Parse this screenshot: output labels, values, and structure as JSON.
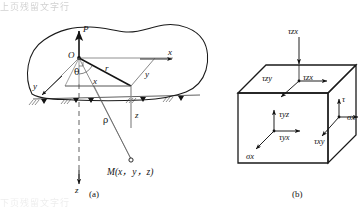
{
  "figure": {
    "caption_a": "(a)",
    "caption_b": "(b)",
    "bleed_top_text": "上页残留文字行",
    "bleed_bottom_text": "下页残留文字行"
  },
  "panel_a": {
    "name": "half-space-coordinate-system",
    "labels": {
      "load_P": "P",
      "origin_O": "O",
      "axis_x": "x",
      "axis_y": "y",
      "axis_z": "z",
      "radial_r": "r",
      "horizontal_x": "x",
      "depth_z": "z",
      "angle_theta": "θ",
      "distance_rho": "ρ",
      "point_M": "M(x，y，z)"
    }
  },
  "panel_b": {
    "name": "stress-element-cube",
    "labels": {
      "top_external": "τzx",
      "top_face_left": "τzy",
      "top_face_right": "τzx",
      "front_face_vertical": "τyz",
      "front_face_horizontal": "τyx",
      "front_face_normal": "σx",
      "right_face_vertical": "τ",
      "right_face_diagonal": "τxy",
      "right_face_normal": "σx"
    },
    "symbols": {
      "tau": "τ",
      "sigma": "σ"
    }
  },
  "colors": {
    "ink": "#141414",
    "line": "#1a1a1a",
    "thin": "#555555",
    "paper": "#ffffff"
  }
}
